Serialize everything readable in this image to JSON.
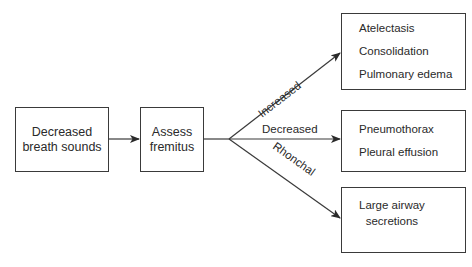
{
  "nodes": {
    "start": {
      "lines": [
        "Decreased",
        "breath sounds"
      ]
    },
    "assess": {
      "lines": [
        "Assess",
        "fremitus"
      ]
    },
    "increased_result": {
      "items": [
        "Atelectasis",
        "Consolidation",
        "Pulmonary edema"
      ]
    },
    "decreased_result": {
      "items": [
        "Pneumothorax",
        "Pleural effusion"
      ]
    },
    "rhonchal_result": {
      "lines": [
        "Large airway",
        "secretions"
      ]
    }
  },
  "edges": {
    "increased": "Increased",
    "decreased": "Decreased",
    "rhonchal": "Rhonchal"
  },
  "colors": {
    "line": "#3a3a3a",
    "text": "#2a2a2a"
  }
}
